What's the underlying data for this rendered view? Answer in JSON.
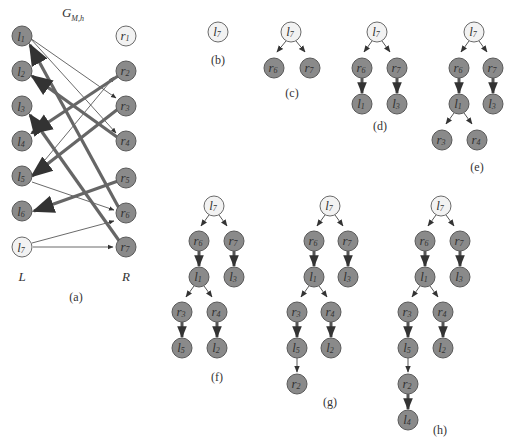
{
  "figure": {
    "graph_title": "G",
    "graph_title_sub": "M,h",
    "left_side_label": "L",
    "right_side_label": "R",
    "colors": {
      "matched_or_visited_node": "#8a8a8a",
      "free_node": "#f2f2f2",
      "edge": "#444444",
      "matching_edge": "#666666"
    },
    "left_nodes": [
      {
        "name": "l",
        "sub": "1",
        "free": false
      },
      {
        "name": "l",
        "sub": "2",
        "free": false
      },
      {
        "name": "l",
        "sub": "3",
        "free": false
      },
      {
        "name": "l",
        "sub": "4",
        "free": false
      },
      {
        "name": "l",
        "sub": "5",
        "free": false
      },
      {
        "name": "l",
        "sub": "6",
        "free": false
      },
      {
        "name": "l",
        "sub": "7",
        "free": true
      }
    ],
    "right_nodes": [
      {
        "name": "r",
        "sub": "1",
        "free": true
      },
      {
        "name": "r",
        "sub": "2",
        "free": false
      },
      {
        "name": "r",
        "sub": "3",
        "free": false
      },
      {
        "name": "r",
        "sub": "4",
        "free": false
      },
      {
        "name": "r",
        "sub": "5",
        "free": false
      },
      {
        "name": "r",
        "sub": "6",
        "free": false
      },
      {
        "name": "r",
        "sub": "7",
        "free": false
      }
    ],
    "edges": [
      {
        "from": "l1",
        "to": "r3",
        "matching": false
      },
      {
        "from": "l1",
        "to": "r4",
        "matching": false
      },
      {
        "from": "l5",
        "to": "r2",
        "matching": false
      },
      {
        "from": "l5",
        "to": "r6",
        "matching": false
      },
      {
        "from": "l7",
        "to": "r6",
        "matching": false
      },
      {
        "from": "l7",
        "to": "r7",
        "matching": false
      },
      {
        "from": "r6",
        "to": "l1",
        "matching": true
      },
      {
        "from": "r4",
        "to": "l2",
        "matching": true
      },
      {
        "from": "r7",
        "to": "l3",
        "matching": true
      },
      {
        "from": "r2",
        "to": "l4",
        "matching": true
      },
      {
        "from": "r3",
        "to": "l5",
        "matching": true
      },
      {
        "from": "r5",
        "to": "l6",
        "matching": true
      }
    ],
    "captions": {
      "a": "(a)",
      "b": "(b)",
      "c": "(c)",
      "d": "(d)",
      "e": "(e)",
      "f": "(f)",
      "g": "(g)",
      "h": "(h)"
    },
    "trees": {
      "b": [
        "l7"
      ],
      "c": [
        "l7",
        "r6",
        "r7"
      ],
      "d": [
        "l7",
        "r6",
        "r7",
        "l1",
        "l3"
      ],
      "e": [
        "l7",
        "r6",
        "r7",
        "l1",
        "l3",
        "r3",
        "r4"
      ],
      "f": [
        "l7",
        "r6",
        "r7",
        "l1",
        "l3",
        "r3",
        "r4",
        "l5",
        "l2"
      ],
      "g": [
        "l7",
        "r6",
        "r7",
        "l1",
        "l3",
        "r3",
        "r4",
        "l5",
        "l2",
        "r2"
      ],
      "h": [
        "l7",
        "r6",
        "r7",
        "l1",
        "l3",
        "r3",
        "r4",
        "l5",
        "l2",
        "r2",
        "l4"
      ]
    }
  }
}
